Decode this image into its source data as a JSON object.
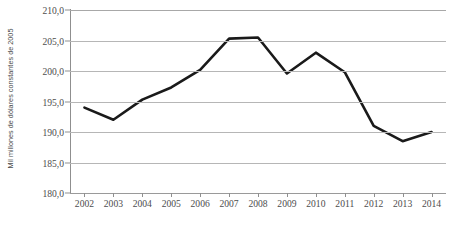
{
  "chart_data": {
    "type": "line",
    "title": "",
    "xlabel": "",
    "ylabel": "Mil millones de dólares constantes de 2005",
    "categories": [
      "2002",
      "2003",
      "2004",
      "2005",
      "2006",
      "2007",
      "2008",
      "2009",
      "2010",
      "2011",
      "2012",
      "2013",
      "2014"
    ],
    "values": [
      194.0,
      192.0,
      195.3,
      197.3,
      200.2,
      205.3,
      205.5,
      199.6,
      203.0,
      199.8,
      191.0,
      188.5,
      190.0
    ],
    "series": [
      {
        "name": "",
        "values": [
          194.0,
          192.0,
          195.3,
          197.3,
          200.2,
          205.3,
          205.5,
          199.6,
          203.0,
          199.8,
          191.0,
          188.5,
          190.0
        ]
      }
    ],
    "ylim": [
      180.0,
      210.0
    ],
    "ytick_values": [
      210.0,
      205.0,
      200.0,
      195.0,
      190.0,
      185.0,
      180.0
    ],
    "ytick_labels": [
      "210,0",
      "205,0",
      "200,0",
      "195,0",
      "190,0",
      "185,0",
      "180,0"
    ],
    "xtick_labels": [
      "2002",
      "2003",
      "2004",
      "2005",
      "2006",
      "2007",
      "2008",
      "2009",
      "2010",
      "2011",
      "2012",
      "2013",
      "2014"
    ],
    "grid": true,
    "grid_axis": "y",
    "legend": false,
    "legend_position": "none",
    "line_color": "#1a1a1a",
    "line_width": 2.6,
    "markers": false,
    "background_color": "#ffffff",
    "grid_color": "#b6b6b6",
    "axis_color": "#8f8f8f",
    "tick_label_color": "#4d4d4d"
  }
}
